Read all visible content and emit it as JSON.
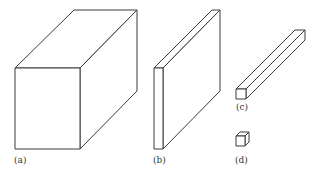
{
  "figure": {
    "stroke_color": "#3a3a3a",
    "background": "#ffffff",
    "shapes": [
      {
        "id": "a",
        "label": "(a)",
        "description": "large rectangular block (cube-like)"
      },
      {
        "id": "b",
        "label": "(b)",
        "description": "thin slab / plate"
      },
      {
        "id": "c",
        "label": "(c)",
        "description": "long thin rod / bar"
      },
      {
        "id": "d",
        "label": "(d)",
        "description": "small cube"
      }
    ]
  }
}
